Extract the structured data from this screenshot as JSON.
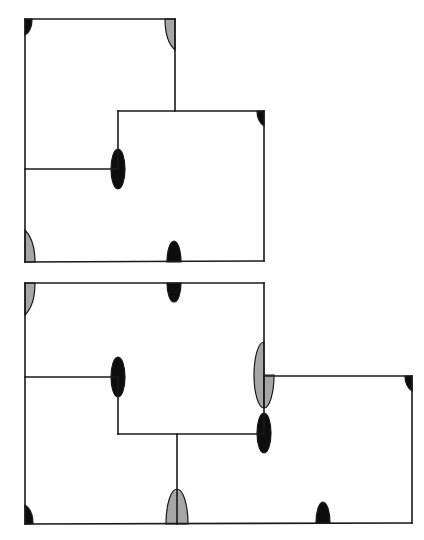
{
  "diagram": {
    "colors": {
      "line": "#1a1a1a",
      "black_marker": "#0d0d0d",
      "gray_marker": "#a6a6a6",
      "background": "#ffffff"
    },
    "figures": [
      {
        "id": "top-figure",
        "segments": [
          [
            25,
            19,
            175,
            19
          ],
          [
            175,
            19,
            175,
            111
          ],
          [
            118,
            111,
            264,
            111
          ],
          [
            264,
            111,
            264,
            261
          ],
          [
            25,
            19,
            25,
            262
          ],
          [
            25,
            262,
            264,
            261
          ],
          [
            25,
            169,
            118,
            169
          ],
          [
            118,
            111,
            118,
            169
          ]
        ],
        "markers": [
          {
            "name": "corner-top-left",
            "type": "corner",
            "x": 25,
            "y": 19,
            "dir": "down-right",
            "color": "black"
          },
          {
            "name": "corner-top-right",
            "type": "corner",
            "x": 175,
            "y": 19,
            "dir": "down-left",
            "color": "gray"
          },
          {
            "name": "corner-right",
            "type": "corner",
            "x": 264,
            "y": 111,
            "dir": "down-left",
            "color": "black"
          },
          {
            "name": "junction-ellipse",
            "type": "ellipse",
            "x": 118,
            "y": 169,
            "rx": 7,
            "ry": 20,
            "color": "black"
          },
          {
            "name": "corner-bottom-left",
            "type": "corner",
            "x": 25,
            "y": 262,
            "dir": "up-right",
            "color": "gray"
          },
          {
            "name": "bottom-half-ellipse",
            "type": "half-up",
            "x": 174,
            "y": 262,
            "rx": 7,
            "ry": 21,
            "color": "black"
          }
        ]
      },
      {
        "id": "bottom-figure",
        "segments": [
          [
            25,
            283,
            264,
            283
          ],
          [
            264,
            283,
            264,
            434
          ],
          [
            264,
            376,
            412,
            376
          ],
          [
            412,
            376,
            412,
            523
          ],
          [
            25,
            283,
            25,
            524
          ],
          [
            25,
            524,
            412,
            523
          ],
          [
            25,
            377,
            118,
            377
          ],
          [
            118,
            377,
            118,
            434
          ],
          [
            118,
            434,
            264,
            434
          ],
          [
            177,
            434,
            177,
            524
          ]
        ],
        "markers": [
          {
            "name": "corner-top-left",
            "type": "corner",
            "x": 25,
            "y": 283,
            "dir": "down-right",
            "color": "gray"
          },
          {
            "name": "top-half-ellipse",
            "type": "half-down",
            "x": 174,
            "y": 283,
            "rx": 7,
            "ry": 19,
            "color": "black"
          },
          {
            "name": "junction-ellipse-left",
            "type": "ellipse",
            "x": 118,
            "y": 377,
            "rx": 7,
            "ry": 20,
            "color": "black"
          },
          {
            "name": "gray-ellipse-left-half",
            "type": "half-left",
            "x": 264,
            "y": 375,
            "rx": 10,
            "ry": 33,
            "color": "gray"
          },
          {
            "name": "gray-ellipse-right-quarter",
            "type": "quarter-right-bottom",
            "x": 264,
            "y": 375,
            "rx": 10,
            "ry": 33,
            "color": "gray"
          },
          {
            "name": "junction-ellipse-right",
            "type": "ellipse",
            "x": 264,
            "y": 433,
            "rx": 7,
            "ry": 20,
            "color": "black"
          },
          {
            "name": "corner-right",
            "type": "corner",
            "x": 412,
            "y": 376,
            "dir": "down-left",
            "color": "black"
          },
          {
            "name": "corner-bottom-left",
            "type": "corner",
            "x": 25,
            "y": 524,
            "dir": "up-right",
            "color": "black"
          },
          {
            "name": "bottom-gray-half-ellipse",
            "type": "half-up",
            "x": 177,
            "y": 524,
            "rx": 11,
            "ry": 35,
            "color": "gray"
          },
          {
            "name": "bottom-black-half-ellipse",
            "type": "half-up",
            "x": 323,
            "y": 523,
            "rx": 7,
            "ry": 21,
            "color": "black"
          }
        ]
      }
    ]
  }
}
